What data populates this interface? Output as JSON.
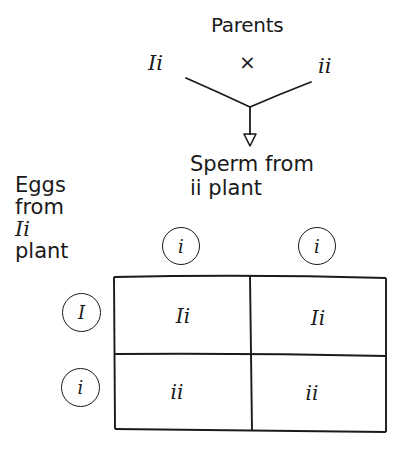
{
  "diagram": {
    "type": "punnett_square",
    "title": "Parents",
    "parents": {
      "left": "Ii",
      "cross_symbol": "×",
      "right": "ii"
    },
    "columns_label": {
      "line1": "Sperm from",
      "line2": "ii plant"
    },
    "rows_label": {
      "line1": "Eggs",
      "line2": "from",
      "line3": "Ii",
      "line4": "plant"
    },
    "column_alleles": [
      "i",
      "i"
    ],
    "row_alleles": [
      "I",
      "i"
    ],
    "cells": [
      [
        "Ii",
        "Ii"
      ],
      [
        "ii",
        "ii"
      ]
    ],
    "colors": {
      "ink": "#1a1a1a",
      "background": "#ffffff"
    }
  }
}
